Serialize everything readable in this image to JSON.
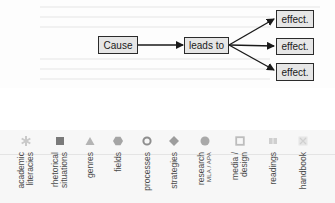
{
  "diagram": {
    "cause": "Cause",
    "middle": "leads to",
    "effects": [
      "effect.",
      "effect.",
      "effect."
    ]
  },
  "colors": {
    "box_fill": "#e6e6e6",
    "box_border": "#2b2b2b",
    "arrow": "#1a1a1a",
    "strip_bg": "#f7f7f7",
    "tab_text": "#4a4a4a"
  },
  "tabs": [
    {
      "id": "academic",
      "line1": "academic",
      "line2": "literacies",
      "icon": "asterisk-icon",
      "color": "#c9c9c9"
    },
    {
      "id": "rhetorical",
      "line1": "rhetorical",
      "line2": "situations",
      "icon": "square-icon",
      "color": "#7a7a7a"
    },
    {
      "id": "genres",
      "line1": "genres",
      "line2": "",
      "icon": "triangle-icon",
      "color": "#b4b4b4"
    },
    {
      "id": "fields",
      "line1": "fields",
      "line2": "",
      "icon": "hexagon-icon",
      "color": "#a5a5a5"
    },
    {
      "id": "processes",
      "line1": "processes",
      "line2": "",
      "icon": "ring-icon",
      "color": "#8e8e8e"
    },
    {
      "id": "strategies",
      "line1": "strategies",
      "line2": "",
      "icon": "diamond-icon",
      "color": "#9d9d9d"
    },
    {
      "id": "research",
      "line1": "research",
      "line2": "MLA / APA",
      "icon": "circle-icon",
      "color": "#a9a9a9"
    },
    {
      "id": "media",
      "line1": "media /",
      "line2": "design",
      "icon": "hollow-square-icon",
      "color": "#bdbdbd"
    },
    {
      "id": "readings",
      "line1": "readings",
      "line2": "",
      "icon": "book-icon",
      "color": "#cfcfcf"
    },
    {
      "id": "handbook",
      "line1": "handbook",
      "line2": "",
      "icon": "x-square-icon",
      "color": "#dedede"
    }
  ]
}
